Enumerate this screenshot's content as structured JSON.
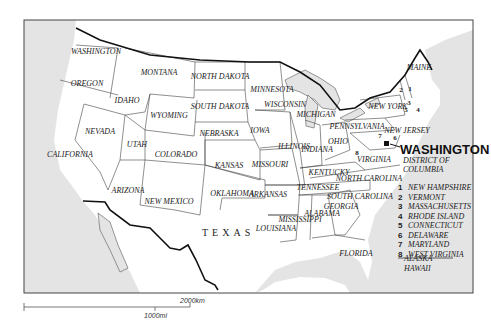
{
  "map": {
    "title": "United States",
    "capital": {
      "name": "WASHINGTON",
      "subtitle": "DISTRICT OF COLUMBIA"
    },
    "states": [
      {
        "name": "WASHINGTON",
        "x": 96,
        "y": 52
      },
      {
        "name": "OREGON",
        "x": 87,
        "y": 84
      },
      {
        "name": "CALIFORNIA",
        "x": 70,
        "y": 155
      },
      {
        "name": "NEVADA",
        "x": 100,
        "y": 132
      },
      {
        "name": "IDAHO",
        "x": 127,
        "y": 101
      },
      {
        "name": "MONTANA",
        "x": 159,
        "y": 73
      },
      {
        "name": "WYOMING",
        "x": 169,
        "y": 116
      },
      {
        "name": "UTAH",
        "x": 137,
        "y": 145
      },
      {
        "name": "COLORADO",
        "x": 176,
        "y": 155
      },
      {
        "name": "ARIZONA",
        "x": 128,
        "y": 191
      },
      {
        "name": "NEW MEXICO",
        "x": 169,
        "y": 202
      },
      {
        "name": "NORTH DAKOTA",
        "x": 220,
        "y": 77
      },
      {
        "name": "SOUTH DAKOTA",
        "x": 220,
        "y": 107
      },
      {
        "name": "NEBRASKA",
        "x": 219,
        "y": 134
      },
      {
        "name": "KANSAS",
        "x": 229,
        "y": 166
      },
      {
        "name": "OKLAHOMA",
        "x": 232,
        "y": 194
      },
      {
        "name": "TEXAS",
        "x": 225,
        "y": 230
      },
      {
        "name": "MINNESOTA",
        "x": 272,
        "y": 90
      },
      {
        "name": "WISCONSIN",
        "x": 285,
        "y": 105
      },
      {
        "name": "IOWA",
        "x": 260,
        "y": 131
      },
      {
        "name": "MISSOURI",
        "x": 270,
        "y": 165
      },
      {
        "name": "ARKANSAS",
        "x": 268,
        "y": 195
      },
      {
        "name": "LOUISIANA",
        "x": 276,
        "y": 229
      },
      {
        "name": "MICHIGAN",
        "x": 316,
        "y": 115
      },
      {
        "name": "ILLINOIS",
        "x": 294,
        "y": 147
      },
      {
        "name": "INDIANA",
        "x": 317,
        "y": 150
      },
      {
        "name": "OHIO",
        "x": 338,
        "y": 142
      },
      {
        "name": "KENTUCKY",
        "x": 329,
        "y": 173
      },
      {
        "name": "TENNESSEE",
        "x": 318,
        "y": 188
      },
      {
        "name": "MISSISSIPPI",
        "x": 300,
        "y": 220
      },
      {
        "name": "ALABAMA",
        "x": 322,
        "y": 214
      },
      {
        "name": "GEORGIA",
        "x": 341,
        "y": 207
      },
      {
        "name": "FLORIDA",
        "x": 356,
        "y": 254
      },
      {
        "name": "NORTH CAROLINA",
        "x": 369,
        "y": 179
      },
      {
        "name": "SOUTH CAROLINA",
        "x": 360,
        "y": 197
      },
      {
        "name": "VIRGINIA",
        "x": 374,
        "y": 160
      },
      {
        "name": "PENNSYLVANIA",
        "x": 357,
        "y": 127
      },
      {
        "name": "NEW YORK",
        "x": 388,
        "y": 107
      },
      {
        "name": "NEW JERSEY",
        "x": 407,
        "y": 131
      },
      {
        "name": "MAINE",
        "x": 419,
        "y": 68
      }
    ],
    "numbered_markers": [
      {
        "n": "1",
        "x": 410,
        "y": 89
      },
      {
        "n": "2",
        "x": 401,
        "y": 90
      },
      {
        "n": "3",
        "x": 409,
        "y": 103
      },
      {
        "n": "4",
        "x": 418,
        "y": 110
      },
      {
        "n": "5",
        "x": 406,
        "y": 110
      },
      {
        "n": "6",
        "x": 395,
        "y": 138
      },
      {
        "name": "7",
        "n": "7",
        "x": 380,
        "y": 136
      },
      {
        "n": "8",
        "x": 357,
        "y": 153
      }
    ],
    "legend": [
      {
        "n": "1",
        "label": "NEW HAMPSHIRE"
      },
      {
        "n": "2",
        "label": "VERMONT"
      },
      {
        "n": "3",
        "label": "MASSACHUSETTS"
      },
      {
        "n": "4",
        "label": "RHODE ISLAND"
      },
      {
        "n": "5",
        "label": "CONNECTICUT"
      },
      {
        "n": "6",
        "label": "DELAWARE"
      },
      {
        "n": "7",
        "label": "MARYLAND"
      },
      {
        "n": "8",
        "label": "WEST VIRGINIA"
      }
    ],
    "extra": [
      "ALASKA",
      "HAWAII"
    ],
    "scale": {
      "km": "2000km",
      "mi": "1000mi"
    }
  }
}
